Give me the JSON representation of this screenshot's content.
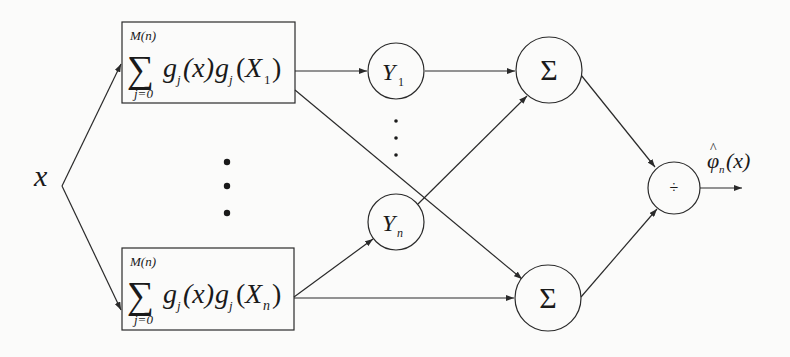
{
  "diagram": {
    "type": "network-block-diagram",
    "colors": {
      "stroke": "#2a2a2a",
      "text": "#1a1a1a",
      "background": "#fbfbfa"
    },
    "input": {
      "label": "x"
    },
    "kernel_boxes": [
      {
        "id": "box-1",
        "sum_upper": "M(n)",
        "sum_lower": "j=0",
        "sum_symbol": "∑",
        "g1": "g",
        "g1_sub": "j",
        "arg1": "(x)",
        "g2": "g",
        "g2_sub": "j",
        "arg2_open": "(",
        "arg2_var": "X",
        "arg2_sub": "1",
        "arg2_close": ")"
      },
      {
        "id": "box-n",
        "sum_upper": "M(n)",
        "sum_lower": "j=0",
        "sum_symbol": "∑",
        "g1": "g",
        "g1_sub": "j",
        "arg1": "(x)",
        "g2": "g",
        "g2_sub": "j",
        "arg2_open": "(",
        "arg2_var": "X",
        "arg2_sub": "n",
        "arg2_close": ")"
      }
    ],
    "weight_nodes": [
      {
        "id": "Y1",
        "var": "Y",
        "sub": "1"
      },
      {
        "id": "Yn",
        "var": "Y",
        "sub": "n"
      }
    ],
    "sum_nodes": [
      {
        "id": "sum-top",
        "symbol": "Σ"
      },
      {
        "id": "sum-bottom",
        "symbol": "Σ"
      }
    ],
    "divide_node": {
      "symbol": "÷"
    },
    "output": {
      "var": "φ",
      "hat": "^",
      "sub": "n",
      "arg": "(x)"
    },
    "ellipsis": {
      "symbol": "•"
    }
  }
}
